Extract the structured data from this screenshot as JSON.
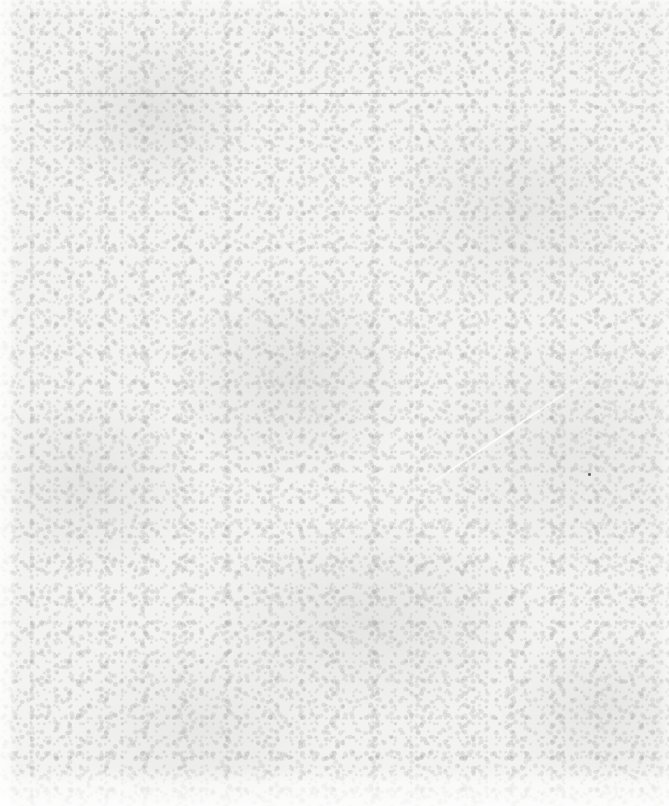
{
  "page": {
    "label": "scanned blank page",
    "width": 669,
    "height": 806,
    "background_color": "#f3f3f1",
    "text_content": "",
    "visible_text": []
  },
  "marks": {
    "horizontal_rule": {
      "label": "faint horizontal rule",
      "x": 18,
      "y": 93,
      "width": 479,
      "color": "#666664"
    },
    "speck": {
      "label": "ink speck artifact",
      "x": 588,
      "y": 473,
      "color": "#464644"
    },
    "crease": {
      "label": "faint diagonal paper crease",
      "x": 405,
      "y": 500
    }
  },
  "texture": {
    "label": "paper grain",
    "base_color": "#f3f3f1",
    "grain_color": "#a8a8a4",
    "margin_highlight": "#ffffff"
  }
}
